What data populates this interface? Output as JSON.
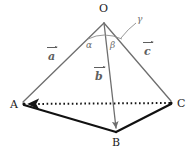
{
  "figure": {
    "kind": "tetrahedron-vector-diagram",
    "background_color": "#ffffff",
    "edge_color_gray": "#6e6e6e",
    "edge_color_black": "#111111",
    "label_color": "#1a1a1a",
    "vertices": [
      {
        "name": "O",
        "label": "O",
        "x": 104,
        "y": 20
      },
      {
        "name": "A",
        "label": "A",
        "x": 22,
        "y": 103
      },
      {
        "name": "B",
        "label": "B",
        "x": 117,
        "y": 133
      },
      {
        "name": "C",
        "label": "C",
        "x": 172,
        "y": 102
      }
    ],
    "vectors": [
      {
        "name": "a",
        "letter": "a",
        "from": "O",
        "to": "A",
        "label_x": 50,
        "label_y": 55
      },
      {
        "name": "b",
        "letter": "b",
        "from": "O",
        "to": "B",
        "label_x": 96,
        "label_y": 75
      },
      {
        "name": "c",
        "letter": "c",
        "from": "O",
        "to": "C",
        "label_x": 145,
        "label_y": 50
      }
    ],
    "angles": [
      {
        "name": "alpha",
        "label": "α",
        "between": "a-b",
        "x": 87,
        "y": 36
      },
      {
        "name": "beta",
        "label": "β",
        "between": "b-c",
        "x": 110,
        "y": 36
      },
      {
        "name": "gamma",
        "label": "γ",
        "between": "a-c",
        "x": 140,
        "y": 18
      }
    ],
    "dotted_edge": {
      "name": "AC",
      "from": "A",
      "to": "C",
      "arrow_at": "A"
    },
    "solid_base_edges": [
      {
        "name": "AB",
        "from": "A",
        "to": "B"
      },
      {
        "name": "BC",
        "from": "B",
        "to": "C"
      }
    ]
  }
}
